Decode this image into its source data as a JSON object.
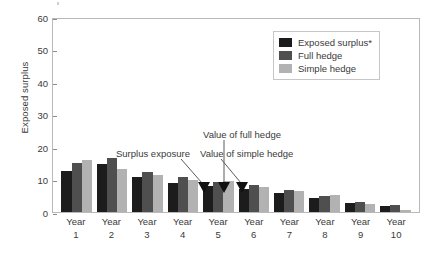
{
  "chart_data": {
    "type": "bar",
    "title": "",
    "xlabel": "",
    "ylabel": "Exposed surplus",
    "ylim": [
      0,
      60
    ],
    "yticks": [
      0,
      10,
      20,
      30,
      40,
      50,
      60
    ],
    "grid": false,
    "legend_position": "top-right",
    "categories": [
      "Year 1",
      "Year 2",
      "Year 3",
      "Year 4",
      "Year 5",
      "Year 6",
      "Year 7",
      "Year 8",
      "Year 9",
      "Year 10"
    ],
    "category_lines": [
      [
        "Year",
        "1"
      ],
      [
        "Year",
        "2"
      ],
      [
        "Year",
        "3"
      ],
      [
        "Year",
        "4"
      ],
      [
        "Year",
        "5"
      ],
      [
        "Year",
        "6"
      ],
      [
        "Year",
        "7"
      ],
      [
        "Year",
        "8"
      ],
      [
        "Year",
        "9"
      ],
      [
        "Year",
        "10"
      ]
    ],
    "series": [
      {
        "name": "Exposed surplus*",
        "color": "#1c1c1c",
        "values": [
          12.5,
          14.8,
          10.7,
          8.8,
          8.0,
          7.0,
          6.0,
          4.3,
          2.7,
          1.9
        ]
      },
      {
        "name": "Full hedge",
        "color": "#4f4f4f",
        "values": [
          15.1,
          16.6,
          12.4,
          10.7,
          9.2,
          8.4,
          6.8,
          5.0,
          3.1,
          2.2
        ]
      },
      {
        "name": "Simple hedge",
        "color": "#b2b2b2",
        "values": [
          16.0,
          13.3,
          11.4,
          9.7,
          9.5,
          7.8,
          6.5,
          5.1,
          2.6,
          0.6
        ]
      }
    ],
    "annotations": [
      {
        "text": "Surplus exposure",
        "target": "Year 4 / Exposed surplus*"
      },
      {
        "text": "Value of full hedge",
        "target": "Year 4 / Full hedge"
      },
      {
        "text": "Value of simple hedge",
        "target": "Year 4 / Simple hedge"
      }
    ]
  },
  "legend": {
    "items": [
      {
        "label": "Exposed surplus*"
      },
      {
        "label": "Full hedge"
      },
      {
        "label": "Simple hedge"
      }
    ]
  },
  "axis": {
    "y_label": "Exposed surplus",
    "y_ticks": [
      "60",
      "50",
      "40",
      "30",
      "20",
      "10",
      "0"
    ]
  },
  "annotations": {
    "surplus_exposure": "Surplus exposure",
    "value_full_hedge": "Value of full hedge",
    "value_simple_hedge": "Value of simple hedge"
  }
}
